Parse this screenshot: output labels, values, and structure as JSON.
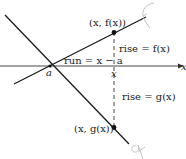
{
  "diagram": {
    "axis_label": "x",
    "point_a_label": "a",
    "point_x_label": "x",
    "f_point_label": "(x, f(x))",
    "g_point_label": "(x, g(x))",
    "run_label": "run = x − a",
    "rise_f_label": "rise = f(x)",
    "rise_g_label": "rise = g(x)",
    "f_curve_annotation": "f",
    "g_curve_annotation": "g"
  },
  "colors": {
    "line": "#1a1a1a",
    "axis": "#333333",
    "annotation": "#bbbbbb"
  }
}
